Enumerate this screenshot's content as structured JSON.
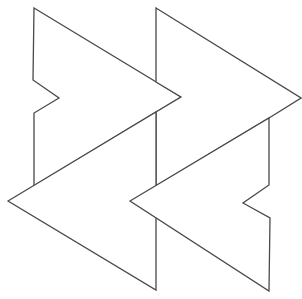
{
  "figure": {
    "width": 302,
    "height": 299,
    "background": "#ffffff",
    "stroke_color": "#4a4a4a",
    "fill_color": "#ffffff",
    "shapes": [
      {
        "name": "right-arrow-left",
        "points": "34,8 181,97 156,112 34,186 34,113 59,98 33,80"
      },
      {
        "name": "right-arrow-right",
        "points": "156,8 301,98 269,118 156,186 156,112 181,97 156,82"
      },
      {
        "name": "left-arrow-left",
        "points": "8,201 156,112 156,290"
      },
      {
        "name": "left-arrow-right",
        "points": "130,201 269,118 269,185 243,203 270,218 269,291"
      }
    ]
  }
}
